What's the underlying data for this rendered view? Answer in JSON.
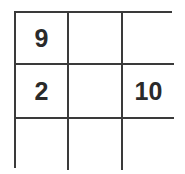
{
  "puzzle": {
    "rows": 3,
    "cols": 3,
    "cells": [
      [
        "9",
        "",
        ""
      ],
      [
        "2",
        "",
        "10"
      ],
      [
        "",
        "",
        ""
      ]
    ]
  }
}
